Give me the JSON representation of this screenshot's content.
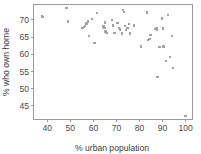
{
  "chart_data": {
    "type": "scatter",
    "title": "",
    "xlabel": "% urban population",
    "ylabel": "% who own home",
    "xlim": [
      34,
      103
    ],
    "ylim": [
      41,
      74.5
    ],
    "xticks": [
      40,
      50,
      60,
      70,
      80,
      90,
      100
    ],
    "yticks": [
      45,
      50,
      55,
      60,
      65,
      70
    ],
    "grid": false,
    "legend": null,
    "marker_color": "#a3a3a3",
    "marker_shape": "square",
    "axis_color": "#9a9a9a",
    "points": [
      {
        "x": 37.6,
        "y": 71.0
      },
      {
        "x": 38.2,
        "y": 70.8
      },
      {
        "x": 48.4,
        "y": 73.4
      },
      {
        "x": 49.0,
        "y": 69.6
      },
      {
        "x": 55.2,
        "y": 67.6
      },
      {
        "x": 55.8,
        "y": 67.9
      },
      {
        "x": 56.4,
        "y": 68.3
      },
      {
        "x": 57.0,
        "y": 69.0
      },
      {
        "x": 57.6,
        "y": 69.6
      },
      {
        "x": 58.2,
        "y": 65.4
      },
      {
        "x": 59.4,
        "y": 70.2
      },
      {
        "x": 60.4,
        "y": 63.2
      },
      {
        "x": 61.6,
        "y": 72.1
      },
      {
        "x": 64.4,
        "y": 68.1
      },
      {
        "x": 64.8,
        "y": 67.6
      },
      {
        "x": 65.0,
        "y": 69.3
      },
      {
        "x": 65.2,
        "y": 66.6
      },
      {
        "x": 65.6,
        "y": 66.2
      },
      {
        "x": 68.0,
        "y": 70.0
      },
      {
        "x": 68.6,
        "y": 68.4
      },
      {
        "x": 69.2,
        "y": 66.2
      },
      {
        "x": 70.4,
        "y": 69.1
      },
      {
        "x": 71.0,
        "y": 67.6
      },
      {
        "x": 71.6,
        "y": 67.2
      },
      {
        "x": 72.4,
        "y": 66.1
      },
      {
        "x": 72.8,
        "y": 72.9
      },
      {
        "x": 73.4,
        "y": 72.4
      },
      {
        "x": 73.6,
        "y": 68.2
      },
      {
        "x": 74.2,
        "y": 67.0
      },
      {
        "x": 74.8,
        "y": 67.6
      },
      {
        "x": 75.4,
        "y": 68.8
      },
      {
        "x": 76.0,
        "y": 66.0
      },
      {
        "x": 77.6,
        "y": 68.4
      },
      {
        "x": 80.6,
        "y": 62.3
      },
      {
        "x": 83.2,
        "y": 72.2
      },
      {
        "x": 83.8,
        "y": 64.2
      },
      {
        "x": 84.4,
        "y": 64.4
      },
      {
        "x": 84.8,
        "y": 65.6
      },
      {
        "x": 86.8,
        "y": 67.4
      },
      {
        "x": 87.4,
        "y": 67.6
      },
      {
        "x": 87.6,
        "y": 67.2
      },
      {
        "x": 87.8,
        "y": 53.4
      },
      {
        "x": 88.6,
        "y": 62.2
      },
      {
        "x": 89.8,
        "y": 70.4
      },
      {
        "x": 90.2,
        "y": 67.5
      },
      {
        "x": 90.4,
        "y": 62.3
      },
      {
        "x": 91.6,
        "y": 58.0
      },
      {
        "x": 92.4,
        "y": 71.5
      },
      {
        "x": 93.2,
        "y": 59.2
      },
      {
        "x": 94.2,
        "y": 65.4
      },
      {
        "x": 94.6,
        "y": 56.0
      },
      {
        "x": 100.0,
        "y": 42.1
      }
    ]
  }
}
